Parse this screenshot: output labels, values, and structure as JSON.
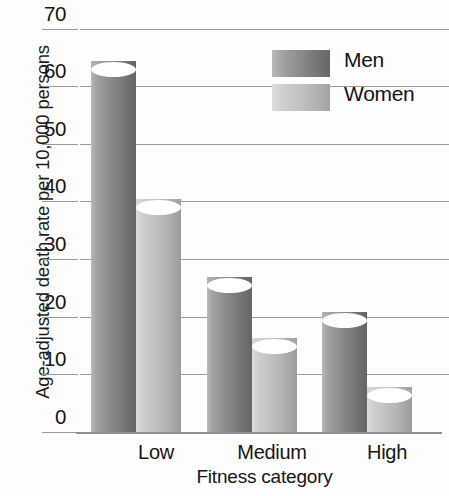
{
  "chart_data": {
    "type": "bar",
    "title": "",
    "subtitle": "",
    "xlabel": "Fitness category",
    "ylabel": "Age-adjusted death rate per 10,000 persons",
    "categories": [
      "Low",
      "Medium",
      "High"
    ],
    "series": [
      {
        "name": "Men",
        "values": [
          63,
          25.5,
          19.5
        ],
        "color": "#8a8a8a"
      },
      {
        "name": "Women",
        "values": [
          39,
          15,
          6.5
        ],
        "color": "#c2c2c2"
      }
    ],
    "ylim": [
      0,
      70
    ],
    "ytick_values": [
      0,
      10,
      20,
      30,
      40,
      50,
      60,
      70
    ],
    "ytick_labels": [
      "0",
      "10",
      "20",
      "30",
      "40",
      "50",
      "60",
      "70"
    ],
    "grid": true,
    "grid_axis": "y",
    "legend_position": "top-right",
    "bar_style": "3d-cylinder",
    "orientation": "vertical"
  },
  "axes": {
    "y_title": "Age-adjusted death rate per 10,000 persons",
    "x_title": "Fitness category",
    "y_ticks": [
      {
        "label": "70",
        "value": 70
      },
      {
        "label": "60",
        "value": 60
      },
      {
        "label": "50",
        "value": 50
      },
      {
        "label": "40",
        "value": 40
      },
      {
        "label": "30",
        "value": 30
      },
      {
        "label": "20",
        "value": 20
      },
      {
        "label": "10",
        "value": 10
      },
      {
        "label": "0",
        "value": 0
      }
    ],
    "x_categories": [
      {
        "label": "Low"
      },
      {
        "label": "Medium"
      },
      {
        "label": "High"
      }
    ]
  },
  "legend": {
    "items": [
      {
        "label": "Men",
        "swatch": "men"
      },
      {
        "label": "Women",
        "swatch": "women"
      }
    ]
  },
  "bars": [
    {
      "series": "Men",
      "category": "Low",
      "value": 63
    },
    {
      "series": "Women",
      "category": "Low",
      "value": 39
    },
    {
      "series": "Men",
      "category": "Medium",
      "value": 25.5
    },
    {
      "series": "Women",
      "category": "Medium",
      "value": 15
    },
    {
      "series": "Men",
      "category": "High",
      "value": 19.5
    },
    {
      "series": "Women",
      "category": "High",
      "value": 6.5
    }
  ],
  "colors": {
    "men": "#8a8a8a",
    "women": "#c2c2c2",
    "gridline": "#9a9a9a",
    "axis": "#8f8f8f",
    "text": "#151515",
    "background": "#fdfdfd"
  }
}
